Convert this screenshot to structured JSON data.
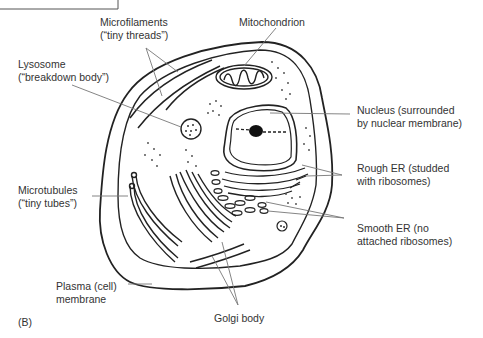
{
  "figure": {
    "panel_label": "(B)",
    "top_box_text": "(?)"
  },
  "labels": {
    "microfilaments": {
      "line1": "Microfilaments",
      "line2": "(“tiny threads”)"
    },
    "mitochondrion": {
      "line1": "Mitochondrion"
    },
    "lysosome": {
      "line1": "Lysosome",
      "line2": "(“breakdown body”)"
    },
    "nucleus": {
      "line1": "Nucleus (surrounded",
      "line2": "by nuclear membrane)"
    },
    "rough_er": {
      "line1": "Rough ER (studded",
      "line2": "with ribosomes)"
    },
    "microtubules": {
      "line1": "Microtubules",
      "line2": "(“tiny tubes”)"
    },
    "smooth_er": {
      "line1": "Smooth ER (no",
      "line2": "attached ribosomes)"
    },
    "plasma_membrane": {
      "line1": "Plasma (cell)",
      "line2": "membrane"
    },
    "golgi": {
      "line1": "Golgi body"
    }
  }
}
